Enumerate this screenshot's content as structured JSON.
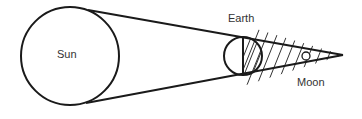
{
  "diagram": {
    "labels": {
      "sun": "Sun",
      "earth": "Earth",
      "moon": "Moon"
    },
    "colors": {
      "stroke": "#1a1a1a",
      "text": "#333333",
      "background": "#ffffff"
    }
  }
}
